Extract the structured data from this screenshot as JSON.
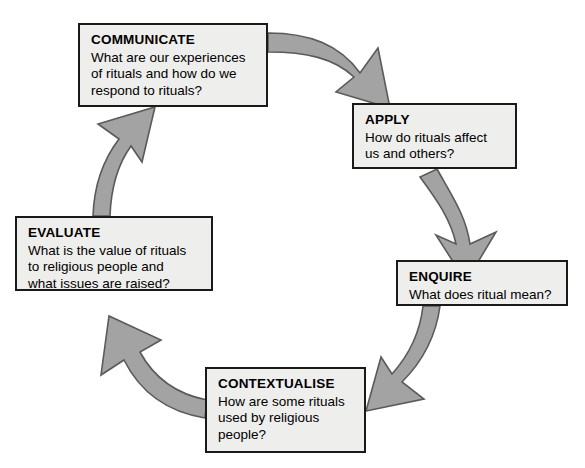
{
  "diagram": {
    "type": "cycle",
    "colors": {
      "arrow_fill": "#a3a3a3",
      "arrow_stroke": "#4d4d4d",
      "box_fill": "#eeeeec",
      "box_border": "#1a1a1a",
      "text": "#000000",
      "background": "#ffffff"
    },
    "nodes": [
      {
        "id": "communicate",
        "title": "COMMUNICATE",
        "text": "What are our experiences\nof rituals and how do we\nrespond to rituals?"
      },
      {
        "id": "apply",
        "title": "APPLY",
        "text": "How do rituals affect\nus and others?"
      },
      {
        "id": "enquire",
        "title": "ENQUIRE",
        "text": "What does ritual mean?"
      },
      {
        "id": "contextualise",
        "title": "CONTEXTUALISE",
        "text": "How are some rituals\nused by religious\npeople?"
      },
      {
        "id": "evaluate",
        "title": "EVALUATE",
        "text": "What is the value of rituals\nto religious people and\nwhat issues are raised?"
      }
    ],
    "arrows": [
      {
        "id": "communicate-to-apply",
        "from": "communicate",
        "to": "apply"
      },
      {
        "id": "apply-to-enquire",
        "from": "apply",
        "to": "enquire"
      },
      {
        "id": "enquire-to-contextualise",
        "from": "enquire",
        "to": "contextualise"
      },
      {
        "id": "contextualise-to-evaluate",
        "from": "contextualise",
        "to": "evaluate"
      },
      {
        "id": "evaluate-to-communicate",
        "from": "evaluate",
        "to": "communicate"
      }
    ]
  }
}
